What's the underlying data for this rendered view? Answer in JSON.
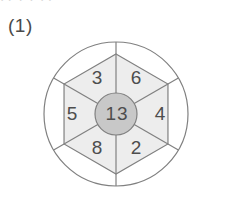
{
  "figure": {
    "label": "(1)",
    "top_artifact_text": "· ·  ·  ·  · ·",
    "type": "hexagon-wheel-puzzle"
  },
  "colors": {
    "stroke": "#808080",
    "hexagon_fill": "#ededed",
    "center_fill": "#c8c8c8",
    "outer_fill": "#ffffff",
    "text": "#4d4d4d",
    "label_text": "#4a4a4a",
    "background": "#ffffff"
  },
  "geometry": {
    "center_x": 116,
    "center_y": 114,
    "outer_radius": 72,
    "hexagon_radius": 60,
    "center_circle_radius": 21
  },
  "center": {
    "name": "center-hub",
    "value": "13"
  },
  "cells": [
    {
      "position": "upper-left",
      "value": "3",
      "x": 97,
      "y": 78
    },
    {
      "position": "upper-right",
      "value": "6",
      "x": 136,
      "y": 78
    },
    {
      "position": "right",
      "value": "4",
      "x": 160,
      "y": 114
    },
    {
      "position": "lower-right",
      "value": "2",
      "x": 136,
      "y": 148
    },
    {
      "position": "lower-left",
      "value": "8",
      "x": 97,
      "y": 148
    },
    {
      "position": "left",
      "value": "5",
      "x": 72,
      "y": 114
    }
  ],
  "outer_segments": [
    {
      "position": "top",
      "value": ""
    },
    {
      "position": "upper-right",
      "value": ""
    },
    {
      "position": "lower-right",
      "value": ""
    },
    {
      "position": "bottom",
      "value": ""
    },
    {
      "position": "lower-left",
      "value": ""
    },
    {
      "position": "upper-left",
      "value": ""
    }
  ]
}
